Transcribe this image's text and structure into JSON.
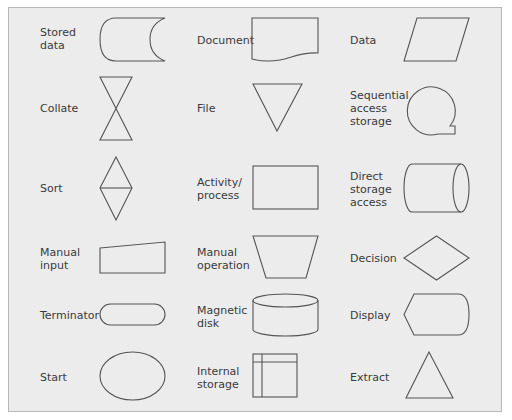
{
  "diagram": {
    "colors": {
      "panel_background": "#ececec",
      "panel_border": "#b8b8b8",
      "stroke": "#555555",
      "text": "#3a3a3a"
    },
    "columns": [
      {
        "items": [
          {
            "label": "Stored\ndata",
            "shape": "stored-data"
          },
          {
            "label": "Collate",
            "shape": "collate"
          },
          {
            "label": "Sort",
            "shape": "sort"
          },
          {
            "label": "Manual\ninput",
            "shape": "manual-input"
          },
          {
            "label": "Terminator",
            "shape": "terminator"
          },
          {
            "label": "Start",
            "shape": "start"
          }
        ]
      },
      {
        "items": [
          {
            "label": "Document",
            "shape": "document"
          },
          {
            "label": "File",
            "shape": "file"
          },
          {
            "label": "Activity/\nprocess",
            "shape": "activity-process"
          },
          {
            "label": "Manual\noperation",
            "shape": "manual-operation"
          },
          {
            "label": "Magnetic\ndisk",
            "shape": "magnetic-disk"
          },
          {
            "label": "Internal\nstorage",
            "shape": "internal-storage"
          }
        ]
      },
      {
        "items": [
          {
            "label": "Data",
            "shape": "data"
          },
          {
            "label": "Sequential\naccess\nstorage",
            "shape": "sequential-access-storage"
          },
          {
            "label": "Direct\nstorage\naccess",
            "shape": "direct-storage-access"
          },
          {
            "label": "Decision",
            "shape": "decision"
          },
          {
            "label": "Display",
            "shape": "display"
          },
          {
            "label": "Extract",
            "shape": "extract"
          }
        ]
      }
    ]
  }
}
